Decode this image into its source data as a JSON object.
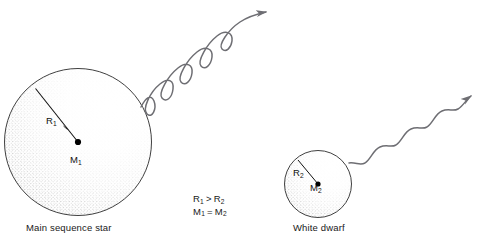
{
  "figure": {
    "clipped_header_text": "",
    "background_color": "#ffffff",
    "ink_color": "#1a1a1a",
    "wave_color": "#6e6e73",
    "stipple_color": "#4a4a4a"
  },
  "main_sequence_star": {
    "caption": "Main sequence star",
    "radius_label": "R",
    "radius_subscript": "1",
    "mass_label": "M",
    "mass_subscript": "1",
    "center_x": 78,
    "center_y": 142,
    "radius_px": 74
  },
  "white_dwarf": {
    "caption": "White dwarf",
    "radius_label": "R",
    "radius_subscript": "2",
    "mass_label": "M",
    "mass_subscript": "2",
    "center_x": 318,
    "center_y": 184,
    "radius_px": 34
  },
  "relations": [
    {
      "left": "R",
      "left_sub": "1",
      "operator": ">",
      "right": "R",
      "right_sub": "2"
    },
    {
      "left": "M",
      "left_sub": "1",
      "operator": "=",
      "right": "M",
      "right_sub": "2"
    }
  ],
  "radiation_waves": [
    {
      "name": "main-sequence-emission",
      "description": "short wavelength large amplitude wave",
      "wavelength_px": 30,
      "amplitude_px": 13,
      "cycles": 4
    },
    {
      "name": "white-dwarf-emission",
      "description": "long wavelength small amplitude wave",
      "wavelength_px": 34,
      "amplitude_px": 8,
      "cycles": 3
    }
  ]
}
